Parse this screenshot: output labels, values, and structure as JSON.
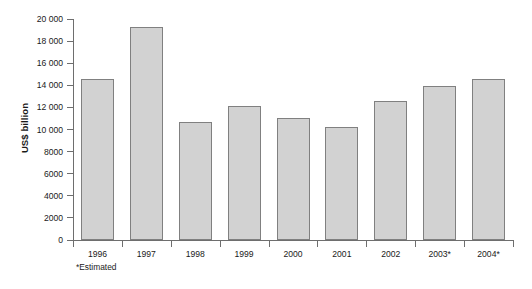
{
  "chart_data": {
    "type": "bar",
    "title": "",
    "subtitle": "",
    "xlabel": "",
    "ylabel": "US$ billion",
    "categories": [
      "1996",
      "1997",
      "1998",
      "1999",
      "2000",
      "2001",
      "2002",
      "2003*",
      "2004*"
    ],
    "values": [
      14600,
      19300,
      10700,
      12100,
      11000,
      10200,
      12600,
      13900,
      14600
    ],
    "series": [
      {
        "name": "US$ billion",
        "values": [
          14600,
          19300,
          10700,
          12100,
          11000,
          10200,
          12600,
          13900,
          14600
        ]
      }
    ],
    "ylim": [
      0,
      20000
    ],
    "ytick_values": [
      0,
      2000,
      4000,
      6000,
      8000,
      10000,
      12000,
      14000,
      16000,
      18000,
      20000
    ],
    "ytick_labels": [
      "0",
      "2000",
      "4000",
      "6000",
      "8000",
      "10 000",
      "12 000",
      "14 000",
      "16 000",
      "18 000",
      "20 000"
    ],
    "grid": false,
    "legend": null,
    "annotations": [
      "*Estimated"
    ],
    "bar_fill_color": "#d2d2d2",
    "bar_border_color": "#808080",
    "axis_color": "#6e6e6e",
    "background_color": "#ffffff"
  },
  "footnote": {
    "text": "*Estimated"
  }
}
